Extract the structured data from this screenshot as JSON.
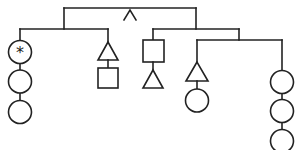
{
  "diagram": {
    "type": "tree",
    "stroke_color": "#222222",
    "background_color": "#ffffff",
    "root_connector_symbol": "∧",
    "special_marker_symbol": "*",
    "branches": [
      {
        "name": "left-group",
        "children": [
          {
            "name": "chain-1",
            "nodes": [
              "circle-with-asterisk",
              "circle",
              "circle"
            ]
          },
          {
            "name": "chain-2",
            "nodes": [
              "triangle",
              "square"
            ]
          }
        ]
      },
      {
        "name": "right-group",
        "children": [
          {
            "name": "chain-3",
            "nodes": [
              "square",
              "triangle"
            ]
          },
          {
            "name": "sub-group",
            "children": [
              {
                "name": "chain-4",
                "nodes": [
                  "triangle",
                  "circle"
                ]
              },
              {
                "name": "chain-5",
                "nodes": [
                  "circle",
                  "circle",
                  "circle"
                ]
              }
            ]
          }
        ]
      }
    ]
  }
}
